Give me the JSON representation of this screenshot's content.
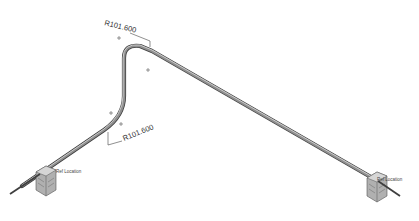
{
  "drawing": {
    "type": "isometric pipe routing view",
    "dimensions": [
      {
        "id": "bend-radius-top",
        "label": "R101.600"
      },
      {
        "id": "bend-radius-lower",
        "label": "R101.600"
      }
    ],
    "supports": [
      {
        "id": "support-left",
        "label": "Fixed Support",
        "label_visible_text": "Ref Location"
      },
      {
        "id": "support-right",
        "label": "Fixed Support",
        "label_visible_text": "Ref Location"
      }
    ],
    "colors": {
      "pipe_dark": "#4a4a4a",
      "pipe_mid": "#8a8a8a",
      "pipe_light": "#c8c8c8",
      "support_fill": "#9a9a9a",
      "support_dark": "#555555",
      "background": "#ffffff"
    }
  }
}
